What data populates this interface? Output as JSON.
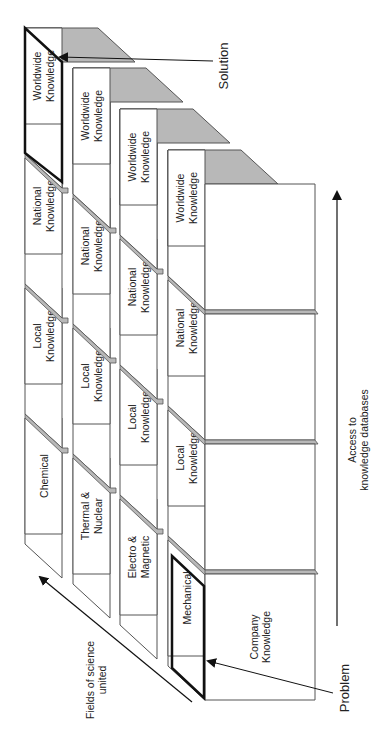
{
  "diagram": {
    "rows": [
      {
        "field": "Chemical",
        "cells": [
          "Worldwide\nKnowledge",
          "National\nKnowledge",
          "Local\nKnowledge",
          "Chemical"
        ]
      },
      {
        "field": "Thermal & Nuclear",
        "cells": [
          "Worldwide\nKnowledge",
          "National\nKnowledge",
          "Local\nKnowledge",
          "Thermal &\nNuclear"
        ]
      },
      {
        "field": "Electro & Magnetic",
        "cells": [
          "Worldwide\nKnowledge",
          "National\nKnowledge",
          "Local\nKnowledge",
          "Electro &\nMagnetic"
        ]
      },
      {
        "field": "Mechanical",
        "cells": [
          "Worldwide\nKnowledge",
          "National\nKnowledge",
          "Local\nKnowledge",
          "Mechanical"
        ]
      }
    ],
    "front_bottom_label": "Company\nKnowledge",
    "annotations": {
      "solution": "Solution",
      "problem": "Problem",
      "fields_axis": "Fields of science\nunited",
      "access_axis": "Access to\nknowledge databases"
    },
    "colors": {
      "top_face": "#b8b8b8",
      "edge": "#555555",
      "highlight": "#111111",
      "face": "#ffffff"
    }
  }
}
